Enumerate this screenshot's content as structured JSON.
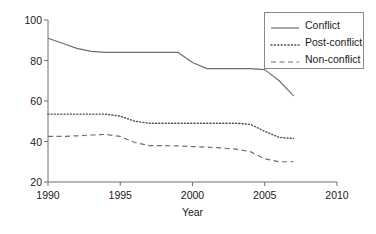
{
  "chart_data": {
    "type": "line",
    "title": "",
    "xlabel": "Year",
    "ylabel": "",
    "xlim": [
      1990,
      2010
    ],
    "ylim": [
      20,
      100
    ],
    "grid": false,
    "legend_position": "top-right",
    "xticks": [
      1990,
      1995,
      2000,
      2005,
      2010
    ],
    "yticks": [
      20,
      40,
      60,
      80,
      100
    ],
    "x": [
      1990,
      1991,
      1992,
      1993,
      1994,
      1995,
      1996,
      1997,
      1998,
      1999,
      2000,
      2001,
      2002,
      2003,
      2004,
      2005,
      2006,
      2007
    ],
    "series": [
      {
        "name": "Conflict",
        "style": "solid",
        "color": "#6e6e6e",
        "values": [
          91,
          88.5,
          86,
          84.5,
          84,
          84,
          84,
          84,
          84,
          84,
          79,
          76,
          76,
          76,
          76,
          75.5,
          70,
          62.5
        ]
      },
      {
        "name": "Post-conflict",
        "style": "dotted",
        "color": "#4d4d4d",
        "values": [
          53.5,
          53.5,
          53.5,
          53.5,
          53.5,
          52.5,
          50,
          49,
          49,
          49,
          49,
          49,
          49,
          49,
          48.5,
          45,
          42,
          41.5
        ]
      },
      {
        "name": "Non-conflict",
        "style": "dashed",
        "color": "#6e6e6e",
        "values": [
          42.5,
          42.5,
          42.8,
          43.2,
          43.5,
          42.5,
          39.5,
          38,
          38,
          37.8,
          37.5,
          37.2,
          36.8,
          36.2,
          35,
          31.5,
          30,
          30
        ]
      }
    ]
  },
  "axis": {
    "xtick_labels": [
      "1990",
      "1995",
      "2000",
      "2005",
      "2010"
    ],
    "ytick_labels": [
      "20",
      "40",
      "60",
      "80",
      "100"
    ],
    "xaxis_title": "Year"
  },
  "legend": {
    "entries": [
      {
        "label": "Conflict",
        "style": "solid"
      },
      {
        "label": "Post-conflict",
        "style": "dotted"
      },
      {
        "label": "Non-conflict",
        "style": "dashed"
      }
    ]
  },
  "colors": {
    "axis": "#6e6e6e",
    "line_conflict": "#6e6e6e",
    "line_post_conflict": "#4d4d4d",
    "line_non_conflict": "#6e6e6e",
    "text": "#1a1a1a",
    "background": "#ffffff"
  }
}
